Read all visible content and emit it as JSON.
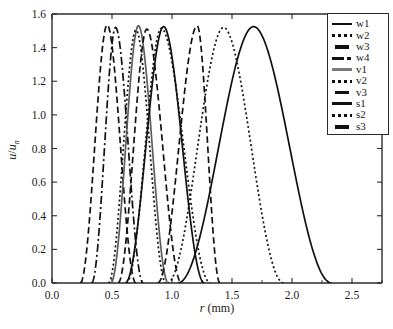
{
  "chart_data": {
    "type": "line",
    "title": "",
    "xlabel": "r (mm)",
    "xlabel_symbol": "r",
    "xlabel_unit": "(mm)",
    "ylabel": "u/u_n",
    "ylabel_numerator": "u",
    "ylabel_denominator": "u",
    "ylabel_subscript": "n",
    "xlim": [
      0.0,
      2.75
    ],
    "ylim": [
      0.0,
      1.6
    ],
    "xticks": [
      0.0,
      0.5,
      1.0,
      1.5,
      2.0,
      2.5
    ],
    "xticklabels": [
      "0.0",
      "0.5",
      "1.0",
      "1.5",
      "2.0",
      "2.5"
    ],
    "yticks": [
      0.0,
      0.2,
      0.4,
      0.6,
      0.8,
      1.0,
      1.2,
      1.4,
      1.6
    ],
    "yticklabels": [
      "0.0",
      "0.2",
      "0.4",
      "0.6",
      "0.8",
      "1.0",
      "1.2",
      "1.4",
      "1.6"
    ],
    "grid": false,
    "legend_position": "upper right",
    "peak_value": 1.53,
    "series": [
      {
        "name": "w1",
        "style": "solid",
        "color": "#111111",
        "peak_x": 1.68,
        "peak_y": 1.525,
        "x_start": 1.05,
        "x_end": 2.33
      },
      {
        "name": "w2",
        "style": "dotted",
        "color": "#111111",
        "peak_x": 1.43,
        "peak_y": 1.52,
        "x_start": 0.96,
        "x_end": 1.93
      },
      {
        "name": "w3",
        "style": "dashed",
        "color": "#111111",
        "peak_x": 0.46,
        "peak_y": 1.535,
        "x_start": 0.235,
        "x_end": 0.7
      },
      {
        "name": "w4",
        "style": "dashdot",
        "color": "#111111",
        "peak_x": 0.53,
        "peak_y": 1.52,
        "x_start": 0.33,
        "x_end": 0.76
      },
      {
        "name": "v1",
        "style": "solid",
        "color": "#5e5e5e",
        "peak_x": 0.72,
        "peak_y": 1.53,
        "x_start": 0.49,
        "x_end": 0.97
      },
      {
        "name": "v2",
        "style": "dotted",
        "color": "#111111",
        "peak_x": 0.7,
        "peak_y": 1.505,
        "x_start": 0.47,
        "x_end": 0.95
      },
      {
        "name": "v3",
        "style": "dashed",
        "color": "#111111",
        "peak_x": 0.79,
        "peak_y": 1.51,
        "x_start": 0.55,
        "x_end": 1.08
      },
      {
        "name": "s1",
        "style": "solid",
        "color": "#111111",
        "peak_x": 0.93,
        "peak_y": 1.525,
        "x_start": 0.61,
        "x_end": 1.27
      },
      {
        "name": "s2",
        "style": "dotted",
        "color": "#111111",
        "peak_x": 0.91,
        "peak_y": 1.515,
        "x_start": 0.62,
        "x_end": 1.32
      },
      {
        "name": "s3",
        "style": "dashed",
        "color": "#111111",
        "peak_x": 1.21,
        "peak_y": 1.53,
        "x_start": 0.88,
        "x_end": 1.4
      }
    ]
  },
  "legend": {
    "entries": [
      {
        "label": "w1",
        "style": "solid"
      },
      {
        "label": "w2",
        "style": "dotted"
      },
      {
        "label": "w3",
        "style": "dashed"
      },
      {
        "label": "w4",
        "style": "dashdot"
      },
      {
        "label": "v1",
        "style": "gray-solid"
      },
      {
        "label": "v2",
        "style": "dotted"
      },
      {
        "label": "v3",
        "style": "dashed"
      },
      {
        "label": "s1",
        "style": "solid"
      },
      {
        "label": "s2",
        "style": "dotted"
      },
      {
        "label": "s3",
        "style": "dashed"
      }
    ]
  }
}
